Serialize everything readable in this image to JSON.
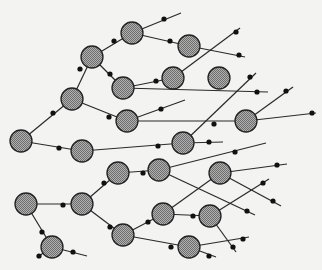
{
  "diagram": {
    "type": "network-graph",
    "colors": {
      "background": "#f3f3f1",
      "edge": "#2a2a2a",
      "junction_dot": "#111111",
      "node_fill_light": "#b0b0b0",
      "node_fill_dark": "#6e6e6e",
      "node_outline": "#222222"
    },
    "node_radius": 11,
    "dot_radius": 2.6,
    "nodes": [
      {
        "id": "n1",
        "x": 21,
        "y": 141
      },
      {
        "id": "n2",
        "x": 72,
        "y": 99
      },
      {
        "id": "n3",
        "x": 92,
        "y": 57
      },
      {
        "id": "n4",
        "x": 132,
        "y": 33
      },
      {
        "id": "n5",
        "x": 189,
        "y": 46
      },
      {
        "id": "n6",
        "x": 123,
        "y": 88
      },
      {
        "id": "n7",
        "x": 173,
        "y": 78
      },
      {
        "id": "n8",
        "x": 219,
        "y": 78
      },
      {
        "id": "n9",
        "x": 127,
        "y": 121
      },
      {
        "id": "n10",
        "x": 246,
        "y": 121
      },
      {
        "id": "n11",
        "x": 82,
        "y": 151
      },
      {
        "id": "n12",
        "x": 183,
        "y": 143
      },
      {
        "id": "n13",
        "x": 118,
        "y": 173
      },
      {
        "id": "n14",
        "x": 159,
        "y": 170
      },
      {
        "id": "n15",
        "x": 220,
        "y": 173
      },
      {
        "id": "n16",
        "x": 26,
        "y": 204
      },
      {
        "id": "n17",
        "x": 82,
        "y": 204
      },
      {
        "id": "n18",
        "x": 52,
        "y": 247
      },
      {
        "id": "n19",
        "x": 123,
        "y": 235
      },
      {
        "id": "n20",
        "x": 163,
        "y": 214
      },
      {
        "id": "n21",
        "x": 210,
        "y": 216
      },
      {
        "id": "n22",
        "x": 189,
        "y": 247
      }
    ],
    "edges": [
      {
        "from": [
          21,
          141
        ],
        "to": [
          72,
          99
        ],
        "dots": [
          [
            53,
            113
          ]
        ]
      },
      {
        "from": [
          72,
          99
        ],
        "to": [
          92,
          57
        ],
        "dots": [
          [
            80,
            69
          ]
        ]
      },
      {
        "from": [
          92,
          57
        ],
        "to": [
          132,
          33
        ],
        "dots": [
          [
            114,
            41
          ]
        ]
      },
      {
        "from": [
          132,
          33
        ],
        "to": [
          181,
          13
        ],
        "dots": [
          [
            164,
            19
          ]
        ]
      },
      {
        "from": [
          132,
          33
        ],
        "to": [
          189,
          46
        ],
        "dots": [
          [
            170,
            41
          ]
        ]
      },
      {
        "from": [
          189,
          46
        ],
        "to": [
          245,
          57
        ],
        "dots": [
          [
            239,
            55
          ]
        ]
      },
      {
        "from": [
          92,
          57
        ],
        "to": [
          123,
          88
        ],
        "dots": [
          [
            110,
            74
          ]
        ]
      },
      {
        "from": [
          123,
          88
        ],
        "to": [
          173,
          78
        ],
        "dots": [
          [
            156,
            81
          ]
        ]
      },
      {
        "from": [
          173,
          78
        ],
        "to": [
          240,
          28
        ],
        "dots": [
          [
            236,
            32
          ]
        ]
      },
      {
        "from": [
          123,
          88
        ],
        "to": [
          268,
          92
        ],
        "dots": [
          [
            257,
            92
          ]
        ]
      },
      {
        "from": [
          72,
          99
        ],
        "to": [
          127,
          121
        ],
        "dots": [
          [
            109,
            117
          ]
        ]
      },
      {
        "from": [
          127,
          121
        ],
        "to": [
          185,
          100
        ],
        "dots": [
          [
            161,
            109
          ]
        ]
      },
      {
        "from": [
          127,
          121
        ],
        "to": [
          246,
          121
        ],
        "dots": [
          [
            214,
            124
          ]
        ]
      },
      {
        "from": [
          246,
          121
        ],
        "to": [
          293,
          87
        ],
        "dots": [
          [
            286,
            91
          ]
        ]
      },
      {
        "from": [
          246,
          121
        ],
        "to": [
          316,
          113
        ],
        "dots": [
          [
            312,
            113
          ]
        ]
      },
      {
        "from": [
          21,
          141
        ],
        "to": [
          82,
          151
        ],
        "dots": [
          [
            59,
            148
          ]
        ]
      },
      {
        "from": [
          82,
          151
        ],
        "to": [
          183,
          143
        ],
        "dots": [
          [
            158,
            146
          ]
        ]
      },
      {
        "from": [
          183,
          143
        ],
        "to": [
          223,
          142
        ],
        "dots": [
          [
            209,
            142
          ]
        ]
      },
      {
        "from": [
          183,
          143
        ],
        "to": [
          256,
          73
        ],
        "dots": [
          [
            250,
            77
          ]
        ]
      },
      {
        "from": [
          82,
          204
        ],
        "to": [
          118,
          173
        ],
        "dots": [
          [
            104,
            183
          ]
        ]
      },
      {
        "from": [
          118,
          173
        ],
        "to": [
          159,
          170
        ],
        "dots": [
          [
            143,
            173
          ]
        ]
      },
      {
        "from": [
          159,
          170
        ],
        "to": [
          266,
          143
        ],
        "dots": [
          [
            235,
            152
          ]
        ]
      },
      {
        "from": [
          159,
          170
        ],
        "to": [
          255,
          215
        ],
        "dots": [
          [
            247,
            211
          ]
        ]
      },
      {
        "from": [
          220,
          173
        ],
        "to": [
          287,
          164
        ],
        "dots": [
          [
            277,
            165
          ]
        ]
      },
      {
        "from": [
          220,
          173
        ],
        "to": [
          281,
          206
        ],
        "dots": [
          [
            273,
            201
          ]
        ]
      },
      {
        "from": [
          163,
          214
        ],
        "to": [
          220,
          173
        ],
        "dots": []
      },
      {
        "from": [
          26,
          204
        ],
        "to": [
          82,
          204
        ],
        "dots": [
          [
            63,
            205
          ]
        ]
      },
      {
        "from": [
          26,
          204
        ],
        "to": [
          52,
          247
        ],
        "dots": [
          [
            42,
            232
          ]
        ]
      },
      {
        "from": [
          52,
          247
        ],
        "to": [
          39,
          256
        ],
        "dots": [
          [
            39,
            256
          ]
        ]
      },
      {
        "from": [
          52,
          247
        ],
        "to": [
          87,
          256
        ],
        "dots": [
          [
            73,
            252
          ]
        ]
      },
      {
        "from": [
          82,
          204
        ],
        "to": [
          123,
          235
        ],
        "dots": [
          [
            110,
            227
          ]
        ]
      },
      {
        "from": [
          123,
          235
        ],
        "to": [
          163,
          214
        ],
        "dots": [
          [
            148,
            222
          ]
        ]
      },
      {
        "from": [
          163,
          214
        ],
        "to": [
          210,
          216
        ],
        "dots": [
          [
            193,
            216
          ]
        ]
      },
      {
        "from": [
          210,
          216
        ],
        "to": [
          269,
          179
        ],
        "dots": [
          [
            263,
            183
          ]
        ]
      },
      {
        "from": [
          210,
          216
        ],
        "to": [
          236,
          252
        ],
        "dots": [
          [
            233,
            247
          ]
        ]
      },
      {
        "from": [
          123,
          235
        ],
        "to": [
          189,
          247
        ],
        "dots": [
          [
            171,
            247
          ]
        ]
      },
      {
        "from": [
          189,
          247
        ],
        "to": [
          249,
          237
        ],
        "dots": [
          [
            243,
            239
          ]
        ]
      },
      {
        "from": [
          189,
          247
        ],
        "to": [
          216,
          257
        ],
        "dots": [
          [
            209,
            256
          ]
        ]
      }
    ]
  }
}
